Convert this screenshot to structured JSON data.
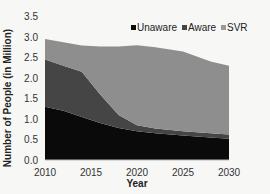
{
  "chart_data": {
    "type": "area",
    "stacked": true,
    "title": "",
    "xlabel": "Year",
    "ylabel": "Number of People (in Million)",
    "xlim": [
      2010,
      2030
    ],
    "ylim": [
      0,
      3.5
    ],
    "x_ticks": [
      "2010",
      "2015",
      "2020",
      "2025",
      "2030"
    ],
    "y_ticks": [
      "0.0",
      "0.5",
      "1.0",
      "1.5",
      "2.0",
      "2.5",
      "3.0",
      "3.5"
    ],
    "grid": false,
    "legend_position": "top-right",
    "x": [
      2010,
      2012,
      2014,
      2016,
      2018,
      2020,
      2022,
      2025,
      2028,
      2030
    ],
    "series": [
      {
        "name": "Unaware",
        "color": "#0a0a0a",
        "values": [
          1.3,
          1.2,
          1.05,
          0.9,
          0.78,
          0.7,
          0.65,
          0.6,
          0.55,
          0.52
        ]
      },
      {
        "name": "Aware",
        "color": "#454545",
        "values": [
          1.15,
          1.1,
          1.1,
          0.7,
          0.32,
          0.15,
          0.12,
          0.1,
          0.1,
          0.1
        ]
      },
      {
        "name": "SVR",
        "color": "#8e8e8e",
        "values": [
          0.5,
          0.57,
          0.64,
          1.17,
          1.67,
          1.95,
          1.98,
          1.95,
          1.75,
          1.68
        ]
      }
    ],
    "totals": [
      2.95,
      2.87,
      2.79,
      2.77,
      2.77,
      2.8,
      2.75,
      2.65,
      2.4,
      2.3
    ]
  },
  "legend": {
    "items": [
      {
        "label": "Unaware",
        "color": "#0a0a0a"
      },
      {
        "label": "Aware",
        "color": "#454545"
      },
      {
        "label": "SVR",
        "color": "#9a9a9a"
      }
    ]
  }
}
